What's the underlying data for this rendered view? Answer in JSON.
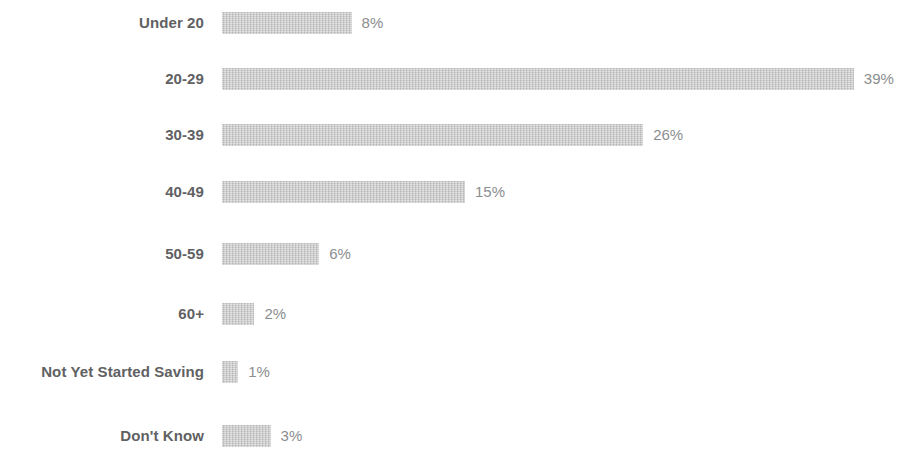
{
  "chart_data": {
    "type": "bar",
    "orientation": "horizontal",
    "title": "",
    "subtitle": "",
    "xlabel": "",
    "ylabel": "",
    "xlim": [
      0,
      39
    ],
    "grid": false,
    "legend": false,
    "value_suffix": "%",
    "categories": [
      "Under 20",
      "20-29",
      "30-39",
      "40-49",
      "50-59",
      "60+",
      "Not Yet Started Saving",
      "Don't Know"
    ],
    "values": [
      8,
      39,
      26,
      15,
      6,
      2,
      1,
      3
    ],
    "value_labels": [
      "8%",
      "39%",
      "26%",
      "15%",
      "6%",
      "2%",
      "1%",
      "3%"
    ],
    "colors": {
      "bar_fill": "#c9c9c9",
      "category_text": "#5f6163",
      "value_text": "#8b8d8f",
      "background": "#ffffff"
    }
  }
}
